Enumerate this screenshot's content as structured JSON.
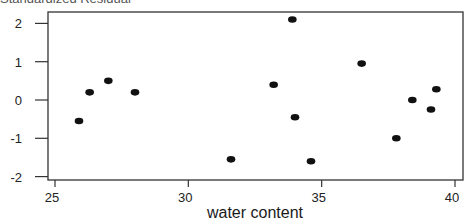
{
  "header": {
    "clipped_text": "Standardized Residual"
  },
  "chart_data": {
    "type": "scatter",
    "title": "",
    "xlabel": "water content",
    "ylabel": "",
    "xlim": [
      24.8,
      40.3
    ],
    "ylim": [
      -2.1,
      2.35
    ],
    "grid": false,
    "legend": null,
    "x_ticks": [
      25,
      30,
      35,
      40
    ],
    "y_ticks": [
      -2,
      -1,
      0,
      1,
      2
    ],
    "points": [
      {
        "x": 25.9,
        "y": -0.55
      },
      {
        "x": 26.3,
        "y": 0.2
      },
      {
        "x": 27.0,
        "y": 0.5
      },
      {
        "x": 28.0,
        "y": 0.2
      },
      {
        "x": 31.6,
        "y": -1.55
      },
      {
        "x": 33.2,
        "y": 0.4
      },
      {
        "x": 33.9,
        "y": 2.1
      },
      {
        "x": 34.0,
        "y": -0.45
      },
      {
        "x": 34.6,
        "y": -1.6
      },
      {
        "x": 36.5,
        "y": 0.95
      },
      {
        "x": 37.8,
        "y": -1.0
      },
      {
        "x": 38.4,
        "y": 0.0
      },
      {
        "x": 39.1,
        "y": -0.25
      },
      {
        "x": 39.3,
        "y": 0.28
      }
    ]
  },
  "style": {
    "point_color": "#111111",
    "axis_color": "#333333"
  }
}
